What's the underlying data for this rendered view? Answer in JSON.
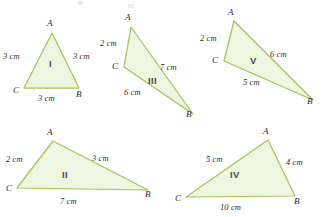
{
  "page": {
    "width": 322,
    "height": 217,
    "background_color": "#fefefe",
    "topic": "congruent-triangles-worksheet"
  },
  "style": {
    "triangle_stroke_color": "#a9c257",
    "triangle_fill_color": "#eef5e0",
    "hatch_color": "#cbdf9a",
    "label_color": "#2f2f2f",
    "roman_color": "#4a4a4a",
    "units": "cm"
  },
  "figures": [
    {
      "id": "triangle-1",
      "roman": "I",
      "roman_pos": {
        "x": 49,
        "y": 59
      },
      "points": [
        {
          "name": "A",
          "x": 52,
          "y": 33
        },
        {
          "name": "B",
          "x": 79,
          "y": 88
        },
        {
          "name": "C",
          "x": 24,
          "y": 88
        }
      ],
      "vertex_labels": [
        {
          "text": "A",
          "x": 47,
          "y": 19
        },
        {
          "text": "B",
          "x": 76,
          "y": 90
        },
        {
          "text": "C",
          "x": 13,
          "y": 86
        }
      ],
      "sides": [
        {
          "text": "3 cm",
          "x": 3,
          "y": 52
        },
        {
          "text": "3 cm",
          "x": 73,
          "y": 52
        },
        {
          "text": "3 cm",
          "x": 38,
          "y": 94
        }
      ]
    },
    {
      "id": "triangle-3",
      "roman": "III",
      "roman_pos": {
        "x": 148,
        "y": 76
      },
      "points": [
        {
          "name": "A",
          "x": 131,
          "y": 27
        },
        {
          "name": "B",
          "x": 193,
          "y": 114
        },
        {
          "name": "C",
          "x": 124,
          "y": 67
        }
      ],
      "vertex_labels": [
        {
          "text": "A",
          "x": 125,
          "y": 13
        },
        {
          "text": "B",
          "x": 186,
          "y": 110
        },
        {
          "text": "C",
          "x": 112,
          "y": 62
        }
      ],
      "sides": [
        {
          "text": "2 cm",
          "x": 100,
          "y": 39
        },
        {
          "text": "7 cm",
          "x": 160,
          "y": 63
        },
        {
          "text": "6 cm",
          "x": 124,
          "y": 88
        }
      ]
    },
    {
      "id": "triangle-5",
      "roman": "V",
      "roman_pos": {
        "x": 250,
        "y": 56
      },
      "points": [
        {
          "name": "A",
          "x": 234,
          "y": 21
        },
        {
          "name": "B",
          "x": 313,
          "y": 100
        },
        {
          "name": "C",
          "x": 224,
          "y": 61
        }
      ],
      "vertex_labels": [
        {
          "text": "A",
          "x": 228,
          "y": 8
        },
        {
          "text": "B",
          "x": 307,
          "y": 97
        },
        {
          "text": "C",
          "x": 212,
          "y": 56
        }
      ],
      "sides": [
        {
          "text": "2 cm",
          "x": 200,
          "y": 34
        },
        {
          "text": "6 cm",
          "x": 270,
          "y": 50
        },
        {
          "text": "5 cm",
          "x": 243,
          "y": 78
        }
      ]
    },
    {
      "id": "triangle-2",
      "roman": "II",
      "roman_pos": {
        "x": 62,
        "y": 170
      },
      "points": [
        {
          "name": "A",
          "x": 53,
          "y": 141
        },
        {
          "name": "B",
          "x": 148,
          "y": 190
        },
        {
          "name": "C",
          "x": 17,
          "y": 188
        }
      ],
      "vertex_labels": [
        {
          "text": "A",
          "x": 47,
          "y": 128
        },
        {
          "text": "B",
          "x": 145,
          "y": 190
        },
        {
          "text": "C",
          "x": 6,
          "y": 184
        }
      ],
      "sides": [
        {
          "text": "2 cm",
          "x": 6,
          "y": 155
        },
        {
          "text": "3 cm",
          "x": 92,
          "y": 154
        },
        {
          "text": "7 cm",
          "x": 60,
          "y": 197
        }
      ]
    },
    {
      "id": "triangle-4",
      "roman": "IV",
      "roman_pos": {
        "x": 230,
        "y": 170
      },
      "points": [
        {
          "name": "A",
          "x": 268,
          "y": 140
        },
        {
          "name": "B",
          "x": 295,
          "y": 196
        },
        {
          "name": "C",
          "x": 186,
          "y": 197
        }
      ],
      "vertex_labels": [
        {
          "text": "A",
          "x": 263,
          "y": 127
        },
        {
          "text": "B",
          "x": 294,
          "y": 197
        },
        {
          "text": "C",
          "x": 175,
          "y": 194
        }
      ],
      "sides": [
        {
          "text": "5 cm",
          "x": 206,
          "y": 155
        },
        {
          "text": "4 cm",
          "x": 286,
          "y": 158
        },
        {
          "text": "10 cm",
          "x": 220,
          "y": 203
        }
      ]
    }
  ]
}
